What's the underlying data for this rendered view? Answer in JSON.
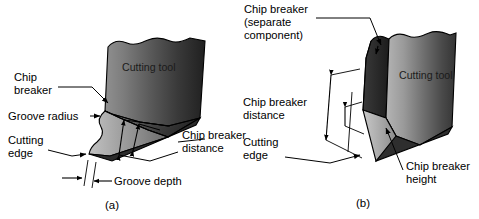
{
  "figure": {
    "background_color": "#ffffff",
    "panels": [
      {
        "id": "a",
        "caption": "(a)",
        "tool_label": "Cutting tool",
        "labels": {
          "chip_breaker_line1": "Chip",
          "chip_breaker_line2": "breaker",
          "groove_radius": "Groove radius",
          "cutting_edge_line1": "Cutting",
          "cutting_edge_line2": "edge",
          "groove_depth": "Groove depth",
          "chip_breaker_distance_line1": "Chip breaker",
          "chip_breaker_distance_line2": "distance"
        }
      },
      {
        "id": "b",
        "caption": "(b)",
        "tool_label": "Cutting tool",
        "labels": {
          "chip_breaker_sep_line1": "Chip breaker",
          "chip_breaker_sep_line2": "(separate",
          "chip_breaker_sep_line3": "component)",
          "chip_breaker_distance_line1": "Chip breaker",
          "chip_breaker_distance_line2": "distance",
          "cutting_edge_line1": "Cutting",
          "cutting_edge_line2": "edge",
          "chip_breaker_height_line1": "Chip breaker",
          "chip_breaker_height_line2": "height"
        }
      }
    ],
    "colors": {
      "outline": "#000000",
      "text": "#000000",
      "tool_light": "#a8a8a8",
      "tool_mid": "#6e6e6e",
      "tool_dark": "#2f2f2f",
      "tool_darkest": "#1a1a1a",
      "breaker_component": "#262626",
      "groove_face": "#555555",
      "flank_light": "#b5b5b5"
    }
  }
}
